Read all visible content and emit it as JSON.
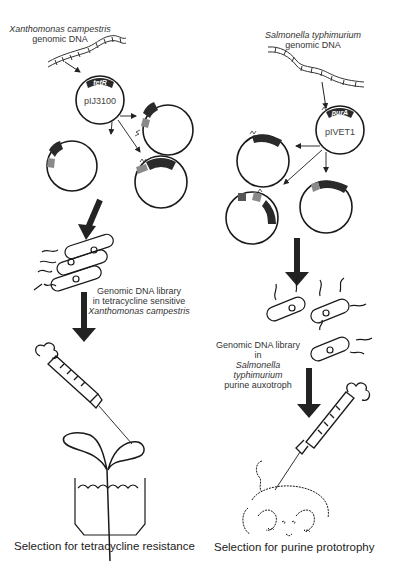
{
  "left_panel": {
    "source_organism": "Xanthomonas campestris",
    "source_suffix": "genomic DNA",
    "vector_name": "pIJ3100",
    "marker_gene": "tetR",
    "library_line1": "Genomic DNA library",
    "library_line2": "in tetracycline sensitive",
    "library_line3": "Xanthomonas campestris",
    "host_label": "plant",
    "caption": "Selection for tetracycline resistance"
  },
  "right_panel": {
    "source_organism": "Salmonella typhimurium",
    "source_suffix": "genomic DNA",
    "vector_name": "pIVET1",
    "marker_gene": "purA",
    "library_line1": "Genomic DNA library in",
    "library_line2": "Salmonella typhimurium",
    "library_line3": "purine auxotroph",
    "host_label": "mouse",
    "caption": "Selection for purine prototrophy"
  },
  "colors": {
    "line": "#1a1a1a",
    "gene_box": "#2a2a2a",
    "insert": "#8a8a8a",
    "arrow": "#333333"
  }
}
